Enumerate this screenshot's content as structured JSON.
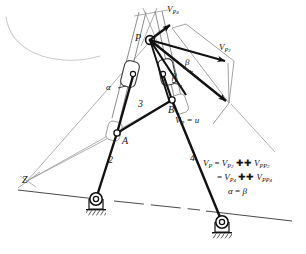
{
  "figure": {
    "type": "kinematic-mechanism-velocity-diagram",
    "title_visible": false,
    "colors": {
      "ink": "#111111",
      "thin_line": "#7a7a7a",
      "faint_line": "#bdbdbd",
      "background": "#ffffff"
    }
  },
  "points": {
    "P": {
      "label": "P",
      "x": 150,
      "y": 40
    },
    "A": {
      "label": "A",
      "x": 117,
      "y": 133
    },
    "B": {
      "label": "B",
      "x": 172,
      "y": 100
    },
    "Z": {
      "label": "Z",
      "x": 27,
      "y": 181
    },
    "pivot_left": {
      "label": "",
      "x": 96,
      "y": 199
    },
    "pivot_right": {
      "label": "",
      "x": 222,
      "y": 222
    }
  },
  "links": {
    "link2": {
      "label": "2",
      "x": 110,
      "y": 160
    },
    "link3": {
      "label": "3",
      "x": 141,
      "y": 104
    },
    "link4": {
      "label": "4",
      "x": 192,
      "y": 158
    }
  },
  "angles": {
    "alpha": {
      "label": "α",
      "x": 110,
      "y": 87
    },
    "beta_upper": {
      "label": "β",
      "x": 186,
      "y": 62
    },
    "beta_lower": {
      "label": "β",
      "x": 174,
      "y": 76
    }
  },
  "vectors": {
    "v_p4": {
      "label_base": "V",
      "label_sub": "P",
      "label_subsub": "4",
      "x": 168,
      "y": 6,
      "tip_x": 172,
      "tip_y": 28
    },
    "v_p2": {
      "label_base": "V",
      "label_sub": "P",
      "label_subsub": "2",
      "x": 220,
      "y": 44,
      "tip_x": 227,
      "tip_y": 64
    },
    "v_p": {
      "text_base": "V",
      "text_sub": "P",
      "text_tail": " = u",
      "x": 176,
      "y": 117
    }
  },
  "equations": {
    "x": 203,
    "y": 160,
    "lines": [
      {
        "parts": [
          {
            "t": "V",
            "k": "b"
          },
          {
            "t": "P",
            "k": "s"
          },
          {
            "t": " = ",
            "k": "o"
          },
          {
            "t": "V",
            "k": "b"
          },
          {
            "t": "P",
            "k": "s"
          },
          {
            "t": "2",
            "k": "ss"
          },
          {
            "t": " ✚ ",
            "k": "o"
          },
          {
            "t": "V",
            "k": "b"
          },
          {
            "t": "PP",
            "k": "s"
          },
          {
            "t": "2",
            "k": "ss"
          }
        ],
        "plain": "V_P = V_P2 ++ V_PP2"
      },
      {
        "parts": [
          {
            "t": "= ",
            "k": "o"
          },
          {
            "t": "V",
            "k": "b"
          },
          {
            "t": "P",
            "k": "s"
          },
          {
            "t": "4",
            "k": "ss"
          },
          {
            "t": " ✚ ",
            "k": "o"
          },
          {
            "t": "V",
            "k": "b"
          },
          {
            "t": "PP",
            "k": "s"
          },
          {
            "t": "4",
            "k": "ss"
          }
        ],
        "plain": "= V_P4 ++ V_PP4"
      },
      {
        "parts": [
          {
            "t": "α",
            "k": "b"
          },
          {
            "t": " = ",
            "k": "o"
          },
          {
            "t": "β",
            "k": "b"
          }
        ],
        "plain": "α = β"
      }
    ]
  }
}
